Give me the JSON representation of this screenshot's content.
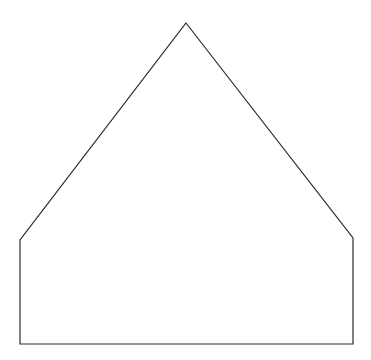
{
  "document": {
    "title": "Pentagon House Shape Line Drawing",
    "width": 371,
    "height": 360,
    "background_color": "#ffffff",
    "description": "A single closed five-sided outline resembling a house or home-plate pentagon: a tall triangular roof sitting on a wide rectangular body. Unfilled white interior, thin dark outline, no text, no labels, no axes."
  },
  "chart_data": {
    "type": "line",
    "subtitle": "",
    "xlabel": "",
    "ylabel": "",
    "xlim": [
      0,
      371
    ],
    "ylim": [
      0,
      360
    ],
    "grid": false,
    "legend": null,
    "annotations": [],
    "tick_labels": {
      "x": [],
      "y": []
    },
    "series": [
      {
        "name": "house-outline",
        "kind": "closed-polygon",
        "closed": true,
        "fill": "none",
        "stroke_color": "#2b2b2b",
        "stroke_width": 1.2,
        "vertex_names": [
          "apex",
          "right-shoulder",
          "bottom-right",
          "bottom-left",
          "left-shoulder"
        ],
        "x": [
          186,
          353,
          353,
          20,
          20
        ],
        "y": [
          23,
          238,
          344,
          344,
          240
        ],
        "points": [
          {
            "name": "apex",
            "x": 186,
            "y": 23
          },
          {
            "name": "right-shoulder",
            "x": 353,
            "y": 238
          },
          {
            "name": "bottom-right",
            "x": 353,
            "y": 344
          },
          {
            "name": "bottom-left",
            "x": 20,
            "y": 344
          },
          {
            "name": "left-shoulder",
            "x": 20,
            "y": 240
          }
        ],
        "edges": [
          {
            "name": "roof-right-slope",
            "from": "apex",
            "to": "right-shoulder"
          },
          {
            "name": "wall-right",
            "from": "right-shoulder",
            "to": "bottom-right"
          },
          {
            "name": "base",
            "from": "bottom-right",
            "to": "bottom-left"
          },
          {
            "name": "wall-left",
            "from": "bottom-left",
            "to": "left-shoulder"
          },
          {
            "name": "roof-left-slope",
            "from": "left-shoulder",
            "to": "apex"
          }
        ]
      }
    ],
    "path_d": "M 186 23 L 353 238 L 353 344 L 20 344 L 20 240 Z"
  },
  "style": {
    "stroke_color": "#2b2b2b",
    "stroke_width": "1.2",
    "fill": "none",
    "background_color": "#ffffff"
  }
}
